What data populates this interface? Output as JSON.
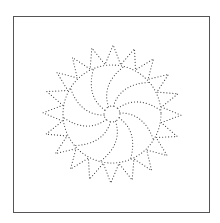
{
  "figure": {
    "type": "dotted-sunburst-drawing",
    "frame": {
      "color": "#555555"
    },
    "dot_color": "#444444",
    "center": [
      112,
      114
    ],
    "hole_radius": 8,
    "ring_radius": 50,
    "tip_radius": 69,
    "spike_count": 20,
    "spoke_count": 10,
    "spoke_twist_deg": 40,
    "rotation_deg": -8
  }
}
